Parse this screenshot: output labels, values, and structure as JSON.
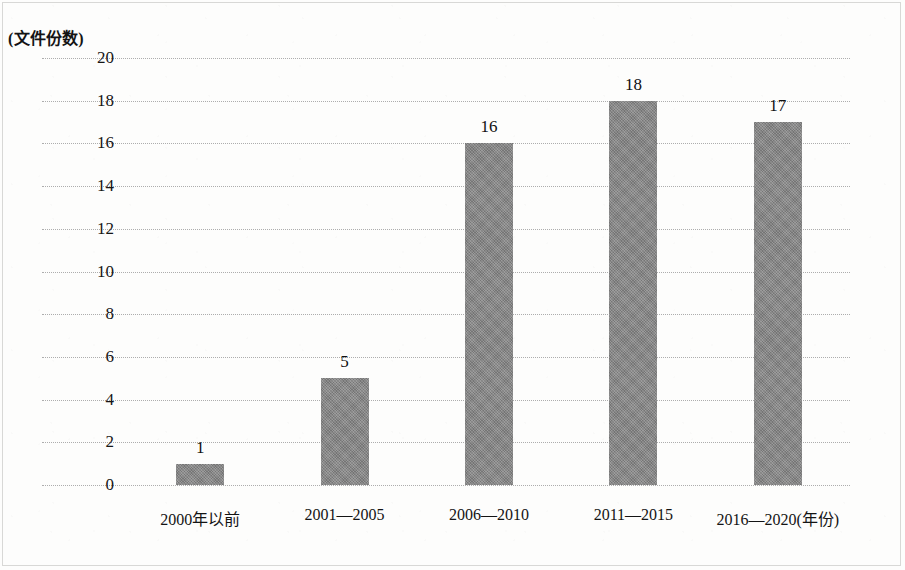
{
  "chart_data": {
    "type": "bar",
    "title": "",
    "subtitle": "",
    "xlabel": "年份",
    "ylabel": "文件份数",
    "ylabel_caption": "(文件份数)",
    "xlabel_caption": "(年份)",
    "categories": [
      "2000年以前",
      "2001—2005",
      "2006—2010",
      "2011—2015",
      "2016—2020"
    ],
    "values": [
      1,
      5,
      16,
      18,
      17
    ],
    "value_labels": [
      "1",
      "5",
      "16",
      "18",
      "17"
    ],
    "ylim": [
      0,
      20
    ],
    "ytick_values": [
      0,
      2,
      4,
      6,
      8,
      10,
      12,
      14,
      16,
      18,
      20
    ],
    "ytick_labels": [
      "0",
      "2",
      "4",
      "6",
      "8",
      "10",
      "12",
      "14",
      "16",
      "18",
      "20"
    ],
    "grid": true,
    "grid_axis": "y",
    "grid_style": "dotted",
    "legend": false,
    "legend_position": "none",
    "bar_color": "#808080",
    "grid_color": "#adadad",
    "text_color": "#141414",
    "background_color": "#fdfdfc"
  }
}
